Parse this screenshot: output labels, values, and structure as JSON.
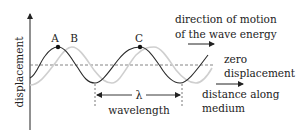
{
  "diagram": {
    "type": "transverse-wave",
    "y_axis_label": "displacement",
    "points": [
      {
        "label": "A"
      },
      {
        "label": "B"
      },
      {
        "label": "C"
      }
    ],
    "wavelength_symbol": "λ",
    "wavelength_label": "wavelength",
    "direction_label_line1": "direction of motion",
    "direction_label_line2": "of the wave energy",
    "zero_label_line1": "zero",
    "zero_label_line2": "displacement",
    "distance_label_line1": "distance along",
    "distance_label_line2": "medium",
    "colors": {
      "wave_current": "#2a2a2a",
      "wave_later": "#cfcfcf",
      "dashed": "#777777",
      "text": "#222222"
    }
  }
}
